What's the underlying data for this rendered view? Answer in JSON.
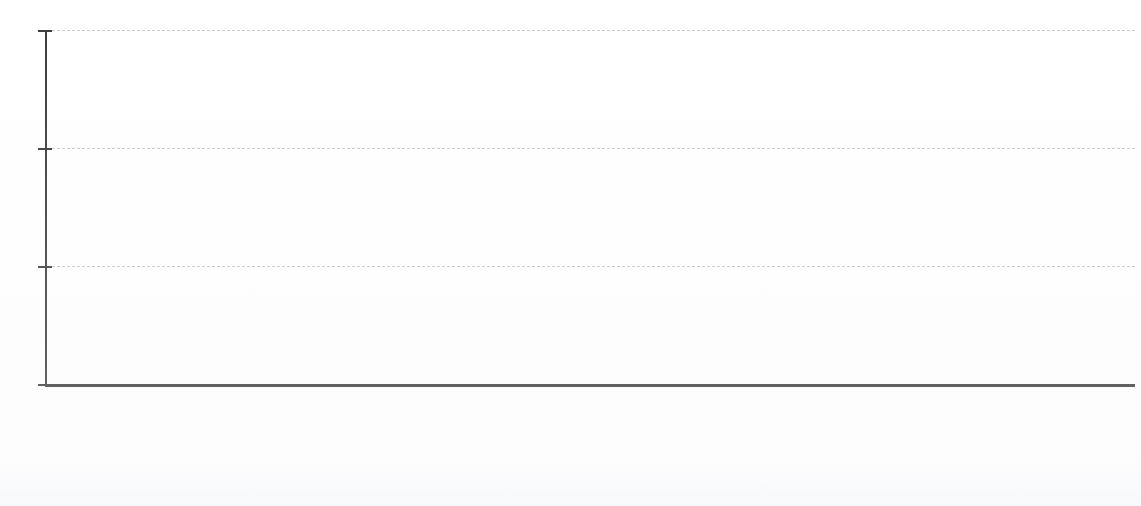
{
  "chart_data": {
    "type": "bar",
    "title": "",
    "subtitle": "",
    "unit_caption": "months",
    "xlabel": "",
    "ylabel": "months",
    "ylim": [
      0,
      180
    ],
    "yticks": [
      0,
      60,
      120,
      180
    ],
    "ytick_labels": [
      "0",
      "60",
      "120",
      "180"
    ],
    "grid": true,
    "grid_axis": "y",
    "legend": false,
    "legend_position": "none",
    "value_suffix": "mos.",
    "categories": [
      "Not Convicted of Drug Mandatory Minimum",
      "Convicted of Drug Mandatory Minimum",
      "Relieved of Mandatory Minimum",
      "Substanial Assistance",
      "Safety Valve",
      "Substantial Assistance & Safety Valve",
      "Subject to Drug Mandatory Minimum"
    ],
    "category_lines": [
      [
        "Not",
        "Convicted of",
        "Drug",
        "Mandatory",
        "Minimum"
      ],
      [
        "Convicted of",
        "Drug",
        "Mandatory",
        "Minimum"
      ],
      [
        "Relieved of",
        "Mandatory",
        "Minimum"
      ],
      [
        "Substanial",
        "Assistance"
      ],
      [
        "Safety Valve"
      ],
      [
        "Substantial",
        "Assistance &",
        "Safety Valve"
      ],
      [
        "Subject to",
        "Drug",
        "Mandatory",
        "Minimum"
      ]
    ],
    "values": [
      42,
      90,
      56,
      73,
      47,
      30,
      120
    ],
    "value_labels": [
      "42 mos.",
      "90 mos.",
      "56 mos.",
      "73 mos.",
      "47 mos.",
      "30 mos.",
      "120 mos."
    ],
    "colors": [
      "#c6c6c3",
      "#6e97d1",
      "#cfe3f2",
      "#e8edf3",
      "#a6c2e6",
      "#7d7d7b",
      "#1a1622"
    ]
  },
  "axis": {
    "unit_caption": "months",
    "tick_180": "180",
    "tick_120": "120",
    "tick_60": "60",
    "tick_0": "0"
  },
  "colors": {
    "axis": "#3b3b3b",
    "gridline": "#c9c9c9",
    "text": "#1c1c1c",
    "background": "#ffffff"
  }
}
